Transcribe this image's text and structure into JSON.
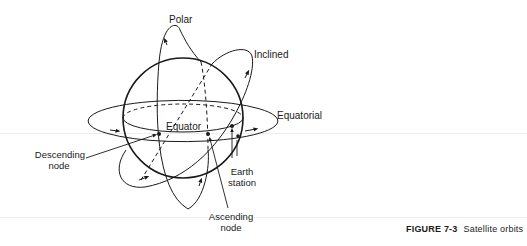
{
  "figure": {
    "number_label": "FIGURE 7-3",
    "caption": "Satellite orbits"
  },
  "labels": {
    "polar": "Polar",
    "inclined": "Inclined",
    "equatorial": "Equatorial",
    "equator": "Equator",
    "descending_node_line1": "Descending",
    "descending_node_line2": "node",
    "ascending_node_line1": "Ascending",
    "ascending_node_line2": "node",
    "earth_station_line1": "Earth",
    "earth_station_line2": "station"
  },
  "colors": {
    "ink": "#1a1a1a",
    "background": "#ffffff"
  }
}
